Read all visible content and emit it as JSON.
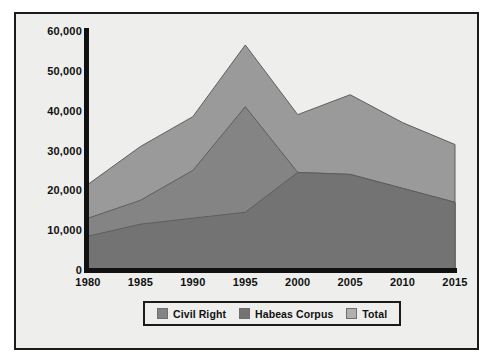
{
  "chart_data": {
    "type": "area",
    "title": "",
    "subtitle": "",
    "xlabel": "",
    "ylabel": "",
    "categories": [
      "1980",
      "1985",
      "1990",
      "1995",
      "2000",
      "2005",
      "2010",
      "2015"
    ],
    "x": [
      1980,
      1985,
      1990,
      1995,
      2000,
      2005,
      2010,
      2015
    ],
    "xlim": [
      1980,
      2015
    ],
    "ylim": [
      0,
      60000
    ],
    "grid": false,
    "stacked": false,
    "legend_position": "bottom",
    "series": [
      {
        "name": "Total",
        "color": "#9a9a9a",
        "values": [
          21500,
          31000,
          38500,
          56500,
          39000,
          44000,
          37000,
          31500
        ]
      },
      {
        "name": "Civil Right",
        "color": "#848484",
        "values": [
          13000,
          17500,
          25000,
          41000,
          24500,
          24000,
          20500,
          17000
        ]
      },
      {
        "name": "Habeas Corpus",
        "color": "#737373",
        "values": [
          8500,
          11500,
          13000,
          14500,
          24500,
          24000,
          20500,
          17000
        ]
      }
    ],
    "y_ticks": [
      0,
      10000,
      20000,
      30000,
      40000,
      50000,
      60000
    ],
    "y_tick_labels": [
      "0",
      "10,000",
      "20,000",
      "30,000",
      "40,000",
      "50,000",
      "60,000"
    ],
    "x_tick_labels": [
      "1980",
      "1985",
      "1990",
      "1995",
      "2000",
      "2005",
      "2010",
      "2015"
    ]
  },
  "legend": {
    "items": [
      {
        "label": "Civil Right",
        "color": "#848484"
      },
      {
        "label": "Habeas Corpus",
        "color": "#737373"
      },
      {
        "label": "Total",
        "color": "#b0b0b0"
      }
    ]
  },
  "colors": {
    "background": "#eeeeec",
    "frame": "#1b1b1b",
    "axis": "#111111",
    "text": "#111111",
    "total_band": "#9a9a9a",
    "civil_right_band": "#848484",
    "habeas_corpus_band": "#737373"
  }
}
